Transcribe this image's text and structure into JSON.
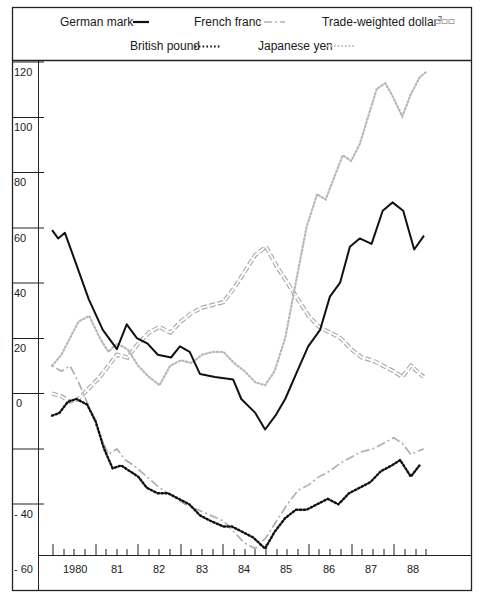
{
  "chart_data": {
    "type": "line",
    "title": "",
    "xlabel": "",
    "ylabel": "",
    "ylim": [
      -60,
      120
    ],
    "xlim": [
      1979.95,
      1988.9
    ],
    "grid": false,
    "legend_position": "top",
    "y_ticks": [
      120,
      100,
      80,
      60,
      40,
      20,
      0,
      -20,
      -40,
      -60
    ],
    "y_tick_labels": [
      "120",
      "100",
      "80",
      "60",
      "40",
      "20",
      "0",
      "",
      "- 40",
      "- 60"
    ],
    "x_tick_labels": [
      "1980",
      "81",
      "82",
      "83",
      "84",
      "85",
      "86",
      "87",
      "88"
    ],
    "x_tick_positions": [
      1980.5,
      1981.5,
      1982.5,
      1983.5,
      1984.5,
      1985.5,
      1986.5,
      1987.5,
      1988.5
    ],
    "legend": [
      {
        "name": "German mark",
        "style": "solid",
        "color": "#111111"
      },
      {
        "name": "French franc",
        "style": "dash-dot",
        "color": "#b0b0b0"
      },
      {
        "name": "Trade-weighted dollar²",
        "style": "hollow-dash",
        "color": "#a8a8a8"
      },
      {
        "name": "British pound",
        "style": "dotted",
        "color": "#111111"
      },
      {
        "name": "Japanese yen",
        "style": "light-dotted",
        "color": "#b8b8b8"
      }
    ],
    "series": [
      {
        "name": "German mark",
        "x": [
          1979.98,
          1980.12,
          1980.28,
          1980.56,
          1980.84,
          1981.17,
          1981.5,
          1981.73,
          1981.97,
          1982.22,
          1982.46,
          1982.77,
          1982.98,
          1983.21,
          1983.45,
          1983.8,
          1984.23,
          1984.42,
          1984.75,
          1984.98,
          1985.22,
          1985.45,
          1985.76,
          1985.99,
          1986.27,
          1986.5,
          1986.74,
          1986.97,
          1987.2,
          1987.48,
          1987.74,
          1987.97,
          1988.22,
          1988.48,
          1988.71
        ],
        "values": [
          59,
          56,
          58,
          46,
          34,
          23,
          16,
          25,
          20,
          18,
          14,
          13,
          17,
          15,
          7,
          6,
          5,
          -2,
          -7,
          -13,
          -8,
          -2,
          9,
          17,
          23,
          35,
          40,
          53,
          56,
          54,
          66,
          69,
          66,
          52,
          57
        ]
      },
      {
        "name": "French franc",
        "x": [
          1979.98,
          1980.2,
          1980.4,
          1980.6,
          1980.85,
          1981.1,
          1981.3,
          1981.5,
          1981.7,
          1981.9,
          1982.2,
          1982.5,
          1982.8,
          1983.1,
          1983.4,
          1983.7,
          1984.0,
          1984.25,
          1984.5,
          1984.75,
          1985.0,
          1985.25,
          1985.5,
          1985.75,
          1986.0,
          1986.25,
          1986.5,
          1986.75,
          1987.0,
          1987.25,
          1987.5,
          1987.75,
          1988.0,
          1988.2,
          1988.4,
          1988.7
        ],
        "values": [
          10,
          8,
          10,
          4,
          -5,
          -15,
          -22,
          -20,
          -24,
          -26,
          -30,
          -34,
          -37,
          -40,
          -42,
          -44,
          -46,
          -50,
          -54,
          -56,
          -52,
          -46,
          -40,
          -35,
          -33,
          -30,
          -28,
          -25,
          -23,
          -21,
          -20,
          -18,
          -16,
          -18,
          -22,
          -20
        ]
      },
      {
        "name": "Trade-weighted dollar²",
        "x": [
          1979.98,
          1980.2,
          1980.4,
          1980.6,
          1980.85,
          1981.1,
          1981.3,
          1981.5,
          1981.75,
          1982.0,
          1982.25,
          1982.5,
          1982.75,
          1983.0,
          1983.25,
          1983.5,
          1983.75,
          1984.0,
          1984.25,
          1984.5,
          1984.75,
          1985.0,
          1985.25,
          1985.5,
          1985.75,
          1986.0,
          1986.25,
          1986.5,
          1986.75,
          1987.0,
          1987.25,
          1987.5,
          1987.75,
          1988.0,
          1988.2,
          1988.4,
          1988.7
        ],
        "values": [
          0,
          -1,
          -3,
          -2,
          2,
          6,
          10,
          14,
          13,
          18,
          22,
          24,
          22,
          26,
          29,
          31,
          32,
          33,
          38,
          44,
          50,
          53,
          46,
          40,
          34,
          28,
          24,
          22,
          20,
          16,
          13,
          12,
          10,
          8,
          6,
          10,
          6
        ]
      },
      {
        "name": "British pound",
        "x": [
          1979.98,
          1980.15,
          1980.35,
          1980.55,
          1980.8,
          1981.0,
          1981.2,
          1981.4,
          1981.6,
          1981.8,
          1982.0,
          1982.2,
          1982.45,
          1982.7,
          1982.95,
          1983.2,
          1983.45,
          1983.7,
          1984.0,
          1984.2,
          1984.45,
          1984.7,
          1984.98,
          1985.2,
          1985.45,
          1985.7,
          1985.95,
          1986.2,
          1986.45,
          1986.7,
          1986.95,
          1987.2,
          1987.45,
          1987.7,
          1987.95,
          1988.15,
          1988.4,
          1988.6
        ],
        "values": [
          -8,
          -7,
          -3,
          -2,
          -4,
          -10,
          -20,
          -27,
          -26,
          -28,
          -30,
          -34,
          -36,
          -36,
          -38,
          -40,
          -44,
          -46,
          -48,
          -48,
          -50,
          -52,
          -56,
          -50,
          -45,
          -42,
          -42,
          -40,
          -38,
          -40,
          -36,
          -34,
          -32,
          -28,
          -26,
          -24,
          -30,
          -26
        ]
      },
      {
        "name": "Japanese yen",
        "x": [
          1979.98,
          1980.2,
          1980.4,
          1980.6,
          1980.85,
          1981.1,
          1981.3,
          1981.5,
          1981.75,
          1982.0,
          1982.25,
          1982.5,
          1982.75,
          1983.0,
          1983.25,
          1983.5,
          1983.75,
          1984.0,
          1984.25,
          1984.5,
          1984.75,
          1984.98,
          1985.2,
          1985.45,
          1985.7,
          1985.95,
          1986.2,
          1986.4,
          1986.6,
          1986.8,
          1987.0,
          1987.2,
          1987.4,
          1987.6,
          1987.8,
          1987.95,
          1988.2,
          1988.4,
          1988.6,
          1988.75
        ],
        "values": [
          10,
          14,
          20,
          26,
          28,
          20,
          15,
          18,
          16,
          10,
          6,
          3,
          10,
          12,
          11,
          14,
          15,
          15,
          11,
          8,
          4,
          3,
          8,
          20,
          40,
          60,
          72,
          70,
          78,
          86,
          84,
          90,
          100,
          110,
          112,
          108,
          100,
          108,
          114,
          116
        ]
      }
    ]
  },
  "legend": {
    "german_mark": "German mark",
    "french_franc": "French franc",
    "trade_weighted_dollar": "Trade-weighted dollar",
    "trade_weighted_dollar_sup": "2",
    "british_pound": "British pound",
    "japanese_yen": "Japanese yen"
  },
  "axis": {
    "y": {
      "t120": "120",
      "t100": "100",
      "t80": "80",
      "t60": "60",
      "t40": "40",
      "t20": "20",
      "t0": "0",
      "tm40": "- 40",
      "tm60": "- 60"
    },
    "x": {
      "y1980": "1980",
      "y81": "81",
      "y82": "82",
      "y83": "83",
      "y84": "84",
      "y85": "85",
      "y86": "86",
      "y87": "87",
      "y88": "88"
    }
  }
}
